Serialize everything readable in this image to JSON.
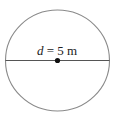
{
  "diagram": {
    "shape": "circle",
    "label": {
      "variable": "d",
      "equals": " = ",
      "value": "5 m"
    },
    "colors": {
      "stroke": "#8a8a8a",
      "diameter": "#555555",
      "dot": "#111111",
      "text": "#222222"
    }
  }
}
